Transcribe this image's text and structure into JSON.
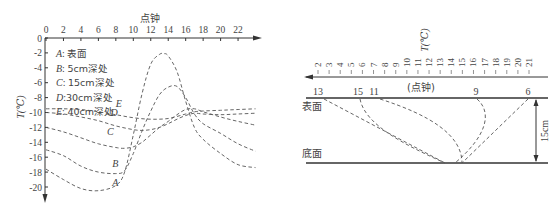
{
  "chart_data": [
    {
      "type": "line",
      "title": "",
      "xlabel": "点钟",
      "ylabel": "T(℃)",
      "x_ticks": [
        0,
        2,
        4,
        6,
        8,
        10,
        12,
        14,
        16,
        18,
        20,
        22
      ],
      "y_ticks": [
        0,
        -2,
        -4,
        -6,
        -8,
        -10,
        -12,
        -14,
        -16,
        -18,
        -20
      ],
      "xlim": [
        0,
        24
      ],
      "ylim": [
        -21,
        0
      ],
      "grid": false,
      "legend_position": "upper-left",
      "legend": [
        "A: 表面",
        "B: 5cm深处",
        "C: 15cm深处",
        "D: 30cm深处",
        "E: 40cm深处"
      ],
      "series": [
        {
          "name": "A",
          "label": "表面",
          "x": [
            0,
            2,
            4,
            6,
            8,
            9,
            10,
            11,
            12,
            13,
            13.5,
            14,
            15,
            16,
            17,
            18,
            20,
            22,
            24
          ],
          "y": [
            -17.6,
            -19,
            -20.2,
            -20.5,
            -19.8,
            -18,
            -13,
            -7.5,
            -3.5,
            -2.2,
            -2.1,
            -2.4,
            -4.5,
            -8.5,
            -12,
            -13.6,
            -15.5,
            -17,
            -17.4
          ]
        },
        {
          "name": "B",
          "label": "5cm深处",
          "x": [
            0,
            2,
            4,
            6,
            8,
            9,
            10,
            11,
            12,
            13,
            14,
            15,
            16,
            17,
            18,
            20,
            22,
            24
          ],
          "y": [
            -15,
            -15.8,
            -17.2,
            -18,
            -18.2,
            -17.8,
            -15.5,
            -12.5,
            -9.8,
            -7.6,
            -6.6,
            -6.5,
            -8,
            -10.2,
            -11.5,
            -12.8,
            -14.2,
            -15.2
          ]
        },
        {
          "name": "C",
          "label": "15cm深处",
          "x": [
            0,
            2,
            4,
            6,
            8,
            9,
            10,
            11,
            12,
            13,
            14,
            15,
            16,
            17,
            18,
            20,
            22,
            24
          ],
          "y": [
            -12,
            -12.6,
            -13.4,
            -14.2,
            -14.7,
            -14.8,
            -14.6,
            -14,
            -13,
            -12,
            -11.2,
            -10.3,
            -9.6,
            -9.5,
            -9.9,
            -10.6,
            -11.2,
            -11.7
          ]
        },
        {
          "name": "D",
          "label": "30cm深处",
          "x": [
            0,
            2,
            4,
            6,
            8,
            10,
            11,
            12,
            13,
            14,
            15,
            16,
            17,
            18,
            20,
            22,
            24
          ],
          "y": [
            -10,
            -10.2,
            -10.6,
            -11.1,
            -11.8,
            -12.3,
            -12.4,
            -12.3,
            -12,
            -11.5,
            -10.9,
            -10.4,
            -10.1,
            -10.2,
            -10.3,
            -10.2,
            -10.1
          ]
        },
        {
          "name": "E",
          "label": "40cm深处",
          "x": [
            0,
            2,
            4,
            6,
            8,
            10,
            12,
            14,
            16,
            17,
            18,
            20,
            22,
            24
          ],
          "y": [
            -9.5,
            -9.5,
            -9.6,
            -9.9,
            -10.3,
            -10.7,
            -10.9,
            -10.8,
            -10.2,
            -9.9,
            -9.8,
            -9.7,
            -9.6,
            -9.5
          ]
        }
      ],
      "curve_labels": [
        {
          "text": "A",
          "x": 7.6,
          "y": -19.8
        },
        {
          "text": "B",
          "x": 7.6,
          "y": -17.3
        },
        {
          "text": "C",
          "x": 7.0,
          "y": -13.0
        },
        {
          "text": "D",
          "x": 7.4,
          "y": -10.5
        },
        {
          "text": "E",
          "x": 8.0,
          "y": -9.3
        }
      ]
    },
    {
      "type": "line",
      "title": "",
      "xlabel": "(点钟)",
      "ylabel": "T(℃)",
      "x_ticks_reversed": true,
      "x_ticks": [
        2,
        3,
        4,
        5,
        6,
        7,
        8,
        9,
        10,
        11,
        12,
        13,
        14,
        15,
        16,
        17,
        18,
        19,
        20,
        21
      ],
      "layers": {
        "top": "表面",
        "bottom": "底面",
        "thickness": "15cm"
      },
      "isotherm_labels_at_surface": [
        13,
        15,
        11,
        9,
        6
      ],
      "series": [
        {
          "name": "13",
          "description": "straight dashed line from surface (13) to bottom",
          "shape": "diagonal"
        },
        {
          "name": "15",
          "description": "curved dashed line from surface (15) to bottom",
          "shape": "curve"
        },
        {
          "name": "11",
          "description": "curved dashed line from surface (11) to bottom",
          "shape": "curve"
        },
        {
          "name": "9",
          "description": "curved dashed line from surface (9) bowing right then to bottom",
          "shape": "curve"
        },
        {
          "name": "6",
          "description": "straight dashed line from surface (6) to bottom",
          "shape": "diagonal"
        }
      ]
    }
  ],
  "left_chart": {
    "x_axis_title": "点钟",
    "y_axis_title": "T(℃)",
    "x_tick_labels": [
      "0",
      "2",
      "4",
      "6",
      "8",
      "10",
      "12",
      "14",
      "16",
      "18",
      "20",
      "22"
    ],
    "y_tick_labels": [
      "0",
      "-2",
      "-4",
      "-6",
      "-8",
      "-10",
      "-12",
      "-14",
      "-16",
      "-18",
      "-20"
    ],
    "legend": [
      {
        "key": "A",
        "sep": ": ",
        "text": "表面"
      },
      {
        "key": "B",
        "sep": ": ",
        "text": "5cm深处"
      },
      {
        "key": "C",
        "sep": ": ",
        "text": "15cm深处"
      },
      {
        "key": "D",
        "sep": ":",
        "text": "30cm深处"
      },
      {
        "key": "E",
        "sep": ": ",
        "text": "40cm深处"
      }
    ]
  },
  "right_chart": {
    "y_axis_title": "T(℃)",
    "x_axis_title": "(点钟)",
    "tick_labels": [
      "2",
      "3",
      "4",
      "5",
      "6",
      "7",
      "8",
      "9",
      "10",
      "11",
      "12",
      "13",
      "14",
      "15",
      "16",
      "17",
      "18",
      "19",
      "20",
      "21"
    ],
    "surface_label": "表面",
    "bottom_label": "底面",
    "depth_label": "15cm",
    "surface_numbers": [
      "13",
      "15",
      "11",
      "9",
      "6"
    ]
  }
}
